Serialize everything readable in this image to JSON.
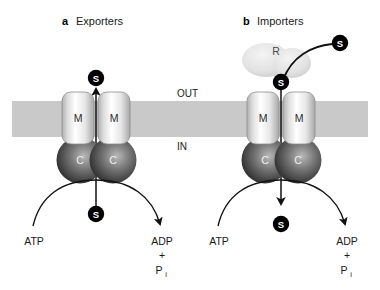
{
  "figure": {
    "panels": [
      {
        "id": "a",
        "letter": "a",
        "title": "Exporters",
        "transport_direction": "out",
        "membrane_domains": [
          {
            "label": "M"
          },
          {
            "label": "M"
          }
        ],
        "nucleotide_domains": [
          {
            "label": "C"
          },
          {
            "label": "C"
          }
        ],
        "substrate_symbol": "S",
        "substrate_markers": [
          "S",
          "S"
        ],
        "energy": {
          "input_label": "ATP",
          "product_label": "ADP",
          "plus_sign": "+",
          "phosphate_label": "P",
          "phosphate_subscript": "i"
        }
      },
      {
        "id": "b",
        "letter": "b",
        "title": "Importers",
        "transport_direction": "in",
        "receptor_label": "R",
        "membrane_domains": [
          {
            "label": "M"
          },
          {
            "label": "M"
          }
        ],
        "nucleotide_domains": [
          {
            "label": "C"
          },
          {
            "label": "C"
          }
        ],
        "substrate_symbol": "S",
        "substrate_markers": [
          "S",
          "S",
          "S"
        ],
        "energy": {
          "input_label": "ATP",
          "product_label": "ADP",
          "plus_sign": "+",
          "phosphate_label": "P",
          "phosphate_subscript": "i"
        }
      }
    ],
    "membrane": {
      "outside_label": "OUT",
      "inside_label": "IN"
    },
    "colors": {
      "membrane_fill": "#c9c9c9",
      "m_domain_light": "#fdfdfd",
      "m_domain_shade": "#b4b4b4",
      "c_domain_light": "#a9a9a9",
      "c_domain_dark": "#3a3a3a",
      "receptor_fill": "#e2e2e2",
      "substrate_fill": "#000000",
      "substrate_text": "#ffffff",
      "stroke": "#111111",
      "background": "#ffffff"
    }
  }
}
